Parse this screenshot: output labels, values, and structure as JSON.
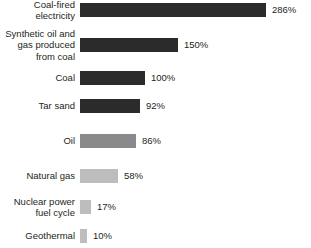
{
  "chart_data": {
    "type": "bar",
    "orientation": "horizontal",
    "title": "",
    "subtitle": "",
    "xlabel": "",
    "ylabel": "",
    "xlim": [
      0,
      286
    ],
    "grid": false,
    "legend": "none",
    "value_suffix": "%",
    "categories": [
      "Coal-fired\nelectricity",
      "Synthetic oil and\ngas produced\nfrom coal",
      "Coal",
      "Tar sand",
      "Oil",
      "Natural gas",
      "Nuclear power\nfuel cycle",
      "Geothermal"
    ],
    "values": [
      286,
      150,
      100,
      92,
      86,
      58,
      17,
      10
    ],
    "value_labels": [
      "286%",
      "150%",
      "100%",
      "92%",
      "86%",
      "58%",
      "17%",
      "10%"
    ],
    "bar_colors": [
      "#2b2b2b",
      "#2b2b2b",
      "#2b2b2b",
      "#2b2b2b",
      "#8a8a8a",
      "#bdbdbd",
      "#bdbdbd",
      "#bdbdbd"
    ],
    "bars": [
      {
        "category": "Coal-fired\nelectricity",
        "value": 286,
        "label": "286%",
        "color": "#2b2b2b",
        "top": 10
      },
      {
        "category": "Synthetic oil and\ngas produced\nfrom coal",
        "value": 150,
        "label": "150%",
        "color": "#2b2b2b",
        "top": 45
      },
      {
        "category": "Coal",
        "value": 100,
        "label": "100%",
        "color": "#2b2b2b",
        "top": 78
      },
      {
        "category": "Tar sand",
        "value": 92,
        "label": "92%",
        "color": "#2b2b2b",
        "top": 106
      },
      {
        "category": "Oil",
        "value": 86,
        "label": "86%",
        "color": "#8a8a8a",
        "top": 141
      },
      {
        "category": "Natural gas",
        "value": 58,
        "label": "58%",
        "color": "#bdbdbd",
        "top": 176
      },
      {
        "category": "Nuclear power\nfuel cycle",
        "value": 17,
        "label": "17%",
        "color": "#bdbdbd",
        "top": 207
      },
      {
        "category": "Geothermal",
        "value": 10,
        "label": "10%",
        "color": "#bdbdbd",
        "top": 236
      }
    ],
    "background_color": "#ffffff",
    "text_color": "#231f20",
    "pixels_per_percent": 0.651,
    "bar_origin_x": 86
  }
}
